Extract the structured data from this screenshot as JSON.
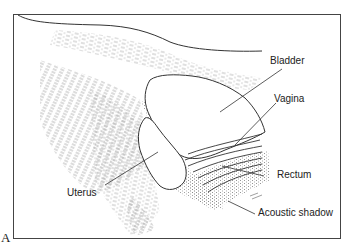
{
  "figure": {
    "panel_label": "A",
    "labels": {
      "bladder": "Bladder",
      "vagina": "Vagina",
      "uterus": "Uterus",
      "rectum": "Rectum",
      "acoustic_shadow": "Acoustic shadow"
    },
    "colors": {
      "line": "#333333",
      "speckle": "#8a8a8a",
      "background": "#ffffff"
    }
  }
}
